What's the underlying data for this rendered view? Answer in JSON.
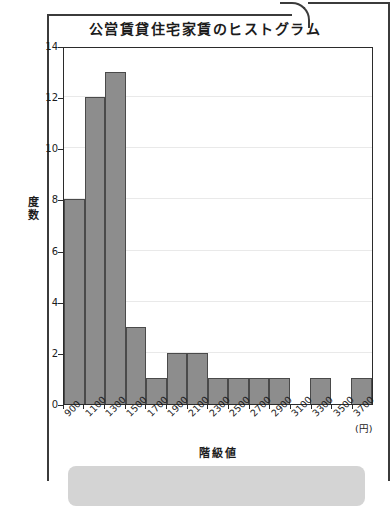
{
  "page": {
    "frame_color": "#3b3b3b",
    "background": "#ffffff"
  },
  "chart_title": "公営賃貸住宅家賃のヒストグラム",
  "axis": {
    "y_label": "度数",
    "x_label": "階級値",
    "x_unit": "(円)"
  },
  "chart_data": {
    "type": "bar",
    "title": "公営賃貸住宅家賃のヒストグラム",
    "xlabel": "階級値",
    "ylabel": "度数",
    "x_unit": "(円)",
    "categories": [
      "900",
      "1100",
      "1300",
      "1500",
      "1700",
      "1900",
      "2100",
      "2300",
      "2500",
      "2700",
      "2900",
      "3100",
      "3300",
      "3500",
      "3700"
    ],
    "values": [
      8,
      12,
      13,
      3,
      1,
      2,
      2,
      1,
      1,
      1,
      1,
      0,
      1,
      0,
      1
    ],
    "ylim": [
      0,
      14
    ],
    "yticks": [
      0,
      2,
      4,
      6,
      8,
      10,
      12,
      14
    ],
    "grid": true,
    "legend": null,
    "bar_fill": "#8d8d8d",
    "bar_stroke": "#4a4a4a"
  }
}
